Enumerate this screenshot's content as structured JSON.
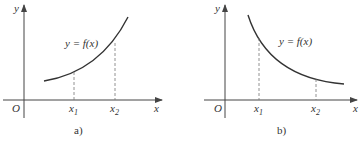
{
  "figure": {
    "panels": [
      {
        "id": "a",
        "caption": "a)",
        "curve_label": "y = f(x)",
        "origin_label": "O",
        "x_axis_label": "x",
        "y_axis_label": "y",
        "tick_labels": [
          "x",
          "x"
        ],
        "tick_subscripts": [
          "1",
          "2"
        ],
        "trend": "increasing"
      },
      {
        "id": "b",
        "caption": "b)",
        "curve_label": "y = f(x)",
        "origin_label": "O",
        "x_axis_label": "x",
        "y_axis_label": "y",
        "tick_labels": [
          "x",
          "x"
        ],
        "tick_subscripts": [
          "1",
          "2"
        ],
        "trend": "decreasing"
      }
    ],
    "colors": {
      "ink": "#333333",
      "axis": "#444444",
      "dashed": "#777777"
    }
  }
}
